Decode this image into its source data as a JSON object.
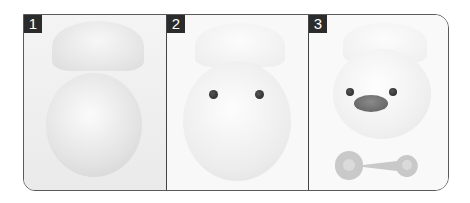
{
  "diagram": {
    "panels": [
      {
        "number": "1",
        "description": "egg-shell-open"
      },
      {
        "number": "2",
        "description": "egg-with-eyes"
      },
      {
        "number": "3",
        "description": "chick-with-beak-and-tool"
      }
    ],
    "colors": {
      "border": "#5a5a5a",
      "label_bg": "#2b2b2b",
      "label_text": "#ffffff"
    }
  }
}
